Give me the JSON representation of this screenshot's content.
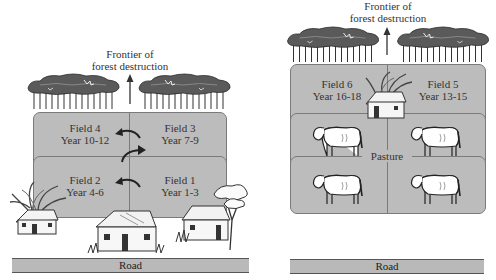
{
  "diagram": {
    "type": "slash-and-burn land use diagram",
    "colors": {
      "field_fill": "#bcbcbc",
      "field_border": "#7a7a7a",
      "road_fill": "#b9b9b9",
      "tree_canopy": "#555555",
      "background": "#ffffff"
    }
  },
  "left_panel": {
    "frontier_label_line1": "Frontier of",
    "frontier_label_line2": "forest destruction",
    "fields": [
      {
        "name": "Field 4",
        "years": "Year 10-12"
      },
      {
        "name": "Field 3",
        "years": "Year 7-9"
      },
      {
        "name": "Field 2",
        "years": "Year 4-6"
      },
      {
        "name": "Field 1",
        "years": "Year 1-3"
      }
    ],
    "road_label": "Road"
  },
  "right_panel": {
    "frontier_label_line1": "Frontier of",
    "frontier_label_line2": "forest destruction",
    "fields": [
      {
        "name": "Field 6",
        "years": "Year 16-18"
      },
      {
        "name": "Field 5",
        "years": "Year 13-15"
      }
    ],
    "pasture_label": "Pasture",
    "road_label": "Road"
  }
}
